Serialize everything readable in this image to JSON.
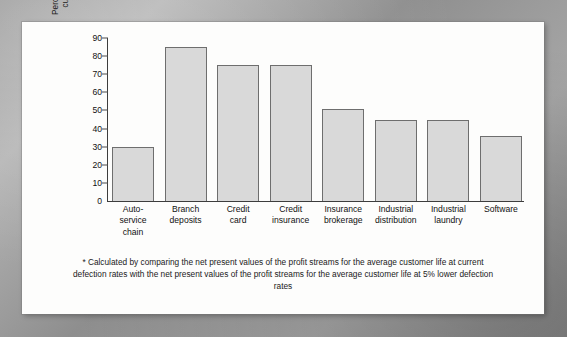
{
  "chart_data": {
    "type": "bar",
    "title": "",
    "xlabel": "",
    "ylabel": "Percent increase in\ncustomer value",
    "ylim": [
      0,
      90
    ],
    "ytick_step": 10,
    "yticks": [
      90,
      80,
      70,
      60,
      50,
      40,
      30,
      20,
      10,
      0
    ],
    "grid": false,
    "legend": "none",
    "categories": [
      "Auto-\nservice\nchain",
      "Branch\ndeposits",
      "Credit\ncard",
      "Credit\ninsurance",
      "Insurance\nbrokerage",
      "Industrial\ndistribution",
      "Industrial\nlaundry",
      "Software"
    ],
    "values": [
      30,
      85,
      75,
      75,
      51,
      45,
      45,
      36
    ],
    "bar_fill_color": "#d9d9d9",
    "bar_border_color": "#6e6e6e",
    "axis_color": "#3d3d3d"
  },
  "footnote": "* Calculated by comparing the net present values of the profit streams for the average customer life at current defection rates with the net present values of the profit streams for the average customer life at 5% lower defection rates",
  "frame": {
    "page_background": "#9e9e9e",
    "card_background": "#fdfdfc"
  }
}
